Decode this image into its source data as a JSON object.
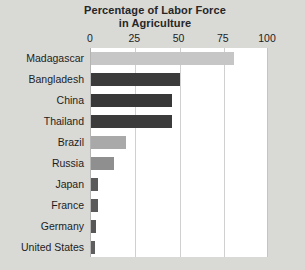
{
  "chart_data": {
    "type": "bar",
    "orientation": "horizontal",
    "title": "Percentage of Labor Force in Agriculture",
    "title_line1": "Percentage of Labor Force",
    "title_line2": "in Agriculture",
    "xlabel": "",
    "ylabel": "",
    "xlim": [
      0,
      100
    ],
    "xticks": [
      0,
      25,
      50,
      75,
      100
    ],
    "xtick_labels": [
      "0",
      "25",
      "50",
      "75",
      "100"
    ],
    "grid": "vertical",
    "legend": "none",
    "categories": [
      "Madagascar",
      "Bangladesh",
      "China",
      "Thailand",
      "Brazil",
      "Russia",
      "Japan",
      "France",
      "Germany",
      "United States"
    ],
    "values": [
      81,
      50,
      46,
      46,
      20,
      13,
      4,
      4,
      3,
      2
    ],
    "bar_colors": [
      "#c6c6c6",
      "#3b3b3b",
      "#383838",
      "#3b3b3b",
      "#a9a9a9",
      "#8f8f8f",
      "#5a5a5a",
      "#5a5a5a",
      "#575757",
      "#5e5e5e"
    ]
  },
  "colors": {
    "page_background": "#d9d9d6",
    "plot_background": "#ffffff",
    "gridline": "#d0d0d0",
    "text": "#1d1d1d",
    "title_text": "#262626"
  }
}
